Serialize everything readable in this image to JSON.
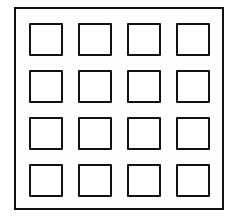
{
  "diagram": {
    "type": "grid-of-squares",
    "rows": 4,
    "columns": 4,
    "cell_count": 16,
    "stroke_color": "#111111",
    "background_color": "#ffffff"
  }
}
